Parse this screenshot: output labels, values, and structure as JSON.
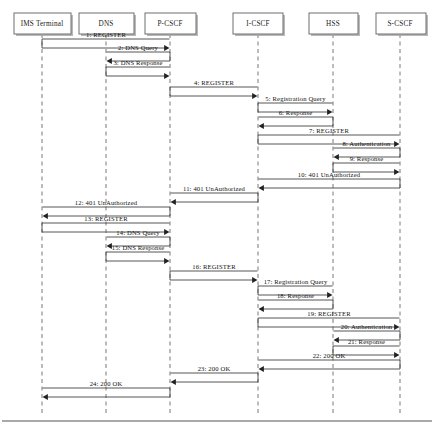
{
  "diagram": {
    "type": "sequence-diagram",
    "canvas": {
      "width": 434,
      "height": 429
    },
    "colors": {
      "background": "#ffffff",
      "lifeline": "#a0a0a0",
      "message": "#444444",
      "box_stroke": "#6e6e6e",
      "text": "#111111"
    },
    "participants": [
      {
        "id": "ims",
        "label": "IMS Terminal",
        "x": 42,
        "box_x": 14,
        "box_w": 57,
        "box_y": 13,
        "box_h": 21
      },
      {
        "id": "dns",
        "label": "DNS",
        "x": 106,
        "box_x": 79,
        "box_w": 55,
        "box_y": 13,
        "box_h": 21
      },
      {
        "id": "pcscf",
        "label": "P-CSCF",
        "x": 170,
        "box_x": 145,
        "box_w": 51,
        "box_y": 13,
        "box_h": 21
      },
      {
        "id": "icscf",
        "label": "I-CSCF",
        "x": 258,
        "box_x": 233,
        "box_w": 50,
        "box_y": 13,
        "box_h": 21
      },
      {
        "id": "hss",
        "label": "HSS",
        "x": 333,
        "box_x": 309,
        "box_w": 49,
        "box_y": 13,
        "box_h": 21
      },
      {
        "id": "scscf",
        "label": "S-CSCF",
        "x": 400,
        "box_x": 376,
        "box_w": 50,
        "box_y": 13,
        "box_h": 21
      }
    ],
    "lifeline_top": 34,
    "lifeline_bottom": 414,
    "frame_bottom_y": 421,
    "messages": [
      {
        "seq": 1,
        "label": "1: REGISTER",
        "from": "ims",
        "to": "pcscf",
        "y": 48,
        "dir": "right"
      },
      {
        "seq": 2,
        "label": "2: DNS Query",
        "from": "pcscf",
        "to": "dns",
        "y": 61,
        "dir": "left"
      },
      {
        "seq": 3,
        "label": "3: DNS Response",
        "from": "dns",
        "to": "pcscf",
        "y": 76,
        "dir": "right"
      },
      {
        "seq": 4,
        "label": "4: REGISTER",
        "from": "pcscf",
        "to": "icscf",
        "y": 96,
        "dir": "right"
      },
      {
        "seq": 5,
        "label": "5: Registration Query",
        "from": "icscf",
        "to": "hss",
        "y": 112,
        "dir": "right"
      },
      {
        "seq": 6,
        "label": "6: Response",
        "from": "hss",
        "to": "icscf",
        "y": 126,
        "dir": "left"
      },
      {
        "seq": 7,
        "label": "7: REGISTER",
        "from": "icscf",
        "to": "scscf",
        "y": 144,
        "dir": "right"
      },
      {
        "seq": 8,
        "label": "8: Authentication",
        "from": "scscf",
        "to": "hss",
        "y": 157,
        "dir": "left"
      },
      {
        "seq": 9,
        "label": "9: Response",
        "from": "hss",
        "to": "scscf",
        "y": 172,
        "dir": "right"
      },
      {
        "seq": 10,
        "label": "10: 401 UnAuthorized",
        "from": "scscf",
        "to": "icscf",
        "y": 188,
        "dir": "left"
      },
      {
        "seq": 11,
        "label": "11: 401 UnAuthorized",
        "from": "icscf",
        "to": "pcscf",
        "y": 202,
        "dir": "left"
      },
      {
        "seq": 12,
        "label": "12: 401 UnAuthorized",
        "from": "pcscf",
        "to": "ims",
        "y": 216,
        "dir": "left"
      },
      {
        "seq": 13,
        "label": "13: REGISTER",
        "from": "ims",
        "to": "pcscf",
        "y": 232,
        "dir": "right"
      },
      {
        "seq": 14,
        "label": "14: DNS Query",
        "from": "pcscf",
        "to": "dns",
        "y": 246,
        "dir": "left"
      },
      {
        "seq": 15,
        "label": "15: DNS Response",
        "from": "dns",
        "to": "pcscf",
        "y": 261,
        "dir": "right"
      },
      {
        "seq": 16,
        "label": "16: REGISTER",
        "from": "pcscf",
        "to": "icscf",
        "y": 280,
        "dir": "right"
      },
      {
        "seq": 17,
        "label": "17: Registration Query",
        "from": "icscf",
        "to": "hss",
        "y": 295,
        "dir": "right"
      },
      {
        "seq": 18,
        "label": "18: Response",
        "from": "hss",
        "to": "icscf",
        "y": 309,
        "dir": "left"
      },
      {
        "seq": 19,
        "label": "19: REGISTER",
        "from": "icscf",
        "to": "scscf",
        "y": 327,
        "dir": "right"
      },
      {
        "seq": 20,
        "label": "20: Authentication",
        "from": "scscf",
        "to": "hss",
        "y": 340,
        "dir": "left"
      },
      {
        "seq": 21,
        "label": "21: Response",
        "from": "hss",
        "to": "scscf",
        "y": 355,
        "dir": "right"
      },
      {
        "seq": 22,
        "label": "22: 200 OK",
        "from": "scscf",
        "to": "icscf",
        "y": 369,
        "dir": "left"
      },
      {
        "seq": 23,
        "label": "23: 200 OK",
        "from": "icscf",
        "to": "pcscf",
        "y": 382,
        "dir": "left"
      },
      {
        "seq": 24,
        "label": "24: 200 OK",
        "from": "pcscf",
        "to": "ims",
        "y": 397,
        "dir": "left"
      }
    ]
  }
}
